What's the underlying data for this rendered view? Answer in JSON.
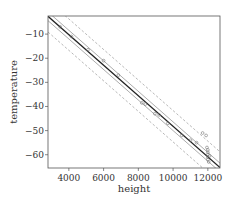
{
  "chart_data": {
    "type": "scatter",
    "title": "",
    "xlabel": "height",
    "ylabel": "temperature",
    "xlim": [
      2800,
      12700
    ],
    "ylim": [
      -65.5,
      -2.5
    ],
    "xticks": [
      4000,
      6000,
      8000,
      10000,
      12000
    ],
    "yticks": [
      -10,
      -20,
      -30,
      -40,
      -50,
      -60
    ],
    "xtick_labels": [
      "4000",
      "6000",
      "8000",
      "10000",
      "12000"
    ],
    "ytick_labels": [
      "−10",
      "−20",
      "−30",
      "−40",
      "−50",
      "−60"
    ],
    "grid": false,
    "legend": null,
    "points": [
      {
        "x": 3500,
        "y": -7
      },
      {
        "x": 4150,
        "y": -11
      },
      {
        "x": 5100,
        "y": -16.5
      },
      {
        "x": 6000,
        "y": -21
      },
      {
        "x": 6850,
        "y": -27
      },
      {
        "x": 8200,
        "y": -38.5
      },
      {
        "x": 8400,
        "y": -39
      },
      {
        "x": 8950,
        "y": -43
      },
      {
        "x": 9200,
        "y": -43.5
      },
      {
        "x": 9700,
        "y": -47
      },
      {
        "x": 10500,
        "y": -52
      },
      {
        "x": 11000,
        "y": -54
      },
      {
        "x": 11350,
        "y": -55
      },
      {
        "x": 11700,
        "y": -51
      },
      {
        "x": 11900,
        "y": -52
      },
      {
        "x": 11950,
        "y": -57
      },
      {
        "x": 12000,
        "y": -58
      },
      {
        "x": 12000,
        "y": -59
      },
      {
        "x": 12000,
        "y": -60
      },
      {
        "x": 12000,
        "y": -61
      },
      {
        "x": 12000,
        "y": -62
      },
      {
        "x": 12050,
        "y": -63
      },
      {
        "x": 12100,
        "y": -60.5
      }
    ],
    "fit_line": {
      "intercept": 15.1,
      "slope": -0.00633,
      "style": "solid",
      "color": "#222222"
    },
    "confidence_band": {
      "offset": 1.8,
      "style": "solid",
      "color": "#888888"
    },
    "prediction_band": {
      "offset": 6.5,
      "style": "dashed",
      "color": "#999999"
    }
  }
}
